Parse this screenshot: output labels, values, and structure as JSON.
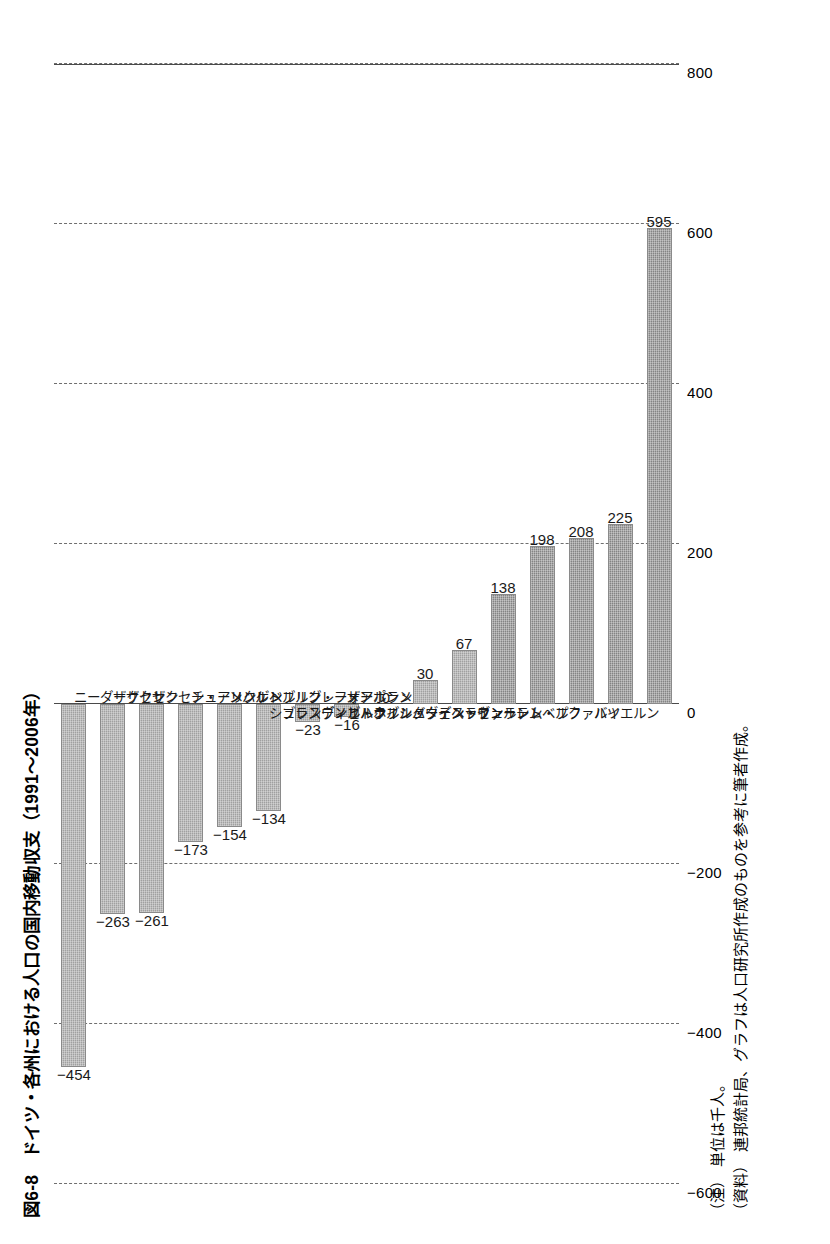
{
  "title": "図6-8　ドイツ・各州における人口の国内移動収支（1991～2006年）",
  "footnotes": [
    {
      "tag": "（注）",
      "text": "単位は千人。"
    },
    {
      "tag": "（資料）",
      "text": "連邦統計局、グラフは人口研究所作成のものを参考に筆者作成。"
    }
  ],
  "chart_data": {
    "type": "bar",
    "title": "図6-8　ドイツ・各州における人口の国内移動収支（1991～2006年）",
    "xlabel": "",
    "ylabel": "",
    "unit": "千人",
    "ylim": [
      -600,
      800
    ],
    "yticks": [
      -600,
      -400,
      -200,
      0,
      200,
      400,
      600,
      800
    ],
    "ytick_labels": [
      "−600",
      "−400",
      "−200",
      "0",
      "200",
      "400",
      "600",
      "800"
    ],
    "grid": true,
    "legend": "none",
    "bar_color": "#9a9a9a",
    "categories": [
      "ニーダーザクセン",
      "ザクセン",
      "ザクセン・アンハルト",
      "チューリンゲン",
      "メクレンブルク・フォアポンメルン",
      "ベルリン",
      "ブレーメン",
      "ザールラント",
      "ブランデンブルク",
      "ハンブルク",
      "シュレスヴィヒ・ホルシュタイン",
      "ヘッセン",
      "ノルトライン・ヴェストファーレン",
      "バーデン・ヴュルテムベルク",
      "ラインラント・プファルツ",
      "バイエルン"
    ],
    "values": [
      -454,
      -263,
      -261,
      -173,
      -154,
      -134,
      -23,
      -16,
      0,
      30,
      67,
      138,
      198,
      208,
      225,
      595
    ],
    "value_labels": [
      "−454",
      "−263",
      "−261",
      "−173",
      "−154",
      "−134",
      "−23",
      "−16",
      "0",
      "30",
      "67",
      "138",
      "198",
      "208",
      "225",
      "595"
    ]
  }
}
